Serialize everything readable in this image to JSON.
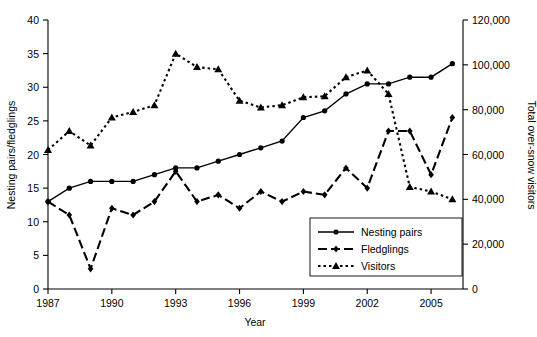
{
  "chart_data": {
    "type": "line",
    "title": "",
    "xlabel": "Year",
    "ylabel": "Nesting pairs/fledglings",
    "y2label": "Total over-snow visitors",
    "grid": false,
    "legend_position": "bottom-right",
    "xlim": [
      1987,
      2006.5
    ],
    "ylim": [
      0,
      40
    ],
    "y2lim": [
      0,
      120000
    ],
    "x_ticks": [
      1987,
      1990,
      1993,
      1996,
      1999,
      2002,
      2005
    ],
    "x_tick_labels": [
      "1987",
      "1990",
      "1993",
      "1996",
      "1999",
      "2002",
      "2005"
    ],
    "y_ticks": [
      0,
      5,
      10,
      15,
      20,
      25,
      30,
      35,
      40
    ],
    "y_tick_labels": [
      "0",
      "5",
      "10",
      "15",
      "20",
      "25",
      "30",
      "35",
      "40"
    ],
    "y2_ticks": [
      0,
      20000,
      40000,
      60000,
      80000,
      100000,
      120000
    ],
    "y2_tick_labels": [
      "0",
      "20,000",
      "40,000",
      "60,000",
      "80,000",
      "100,000",
      "120,000"
    ],
    "x": [
      1987,
      1988,
      1989,
      1990,
      1991,
      1992,
      1993,
      1994,
      1995,
      1996,
      1997,
      1998,
      1999,
      2000,
      2001,
      2002,
      2003,
      2004,
      2005,
      2006
    ],
    "series": [
      {
        "name": "Nesting pairs",
        "axis": "left",
        "marker": "circle",
        "linestyle": "solid",
        "values": [
          13,
          15,
          16,
          16,
          16,
          17,
          18,
          18,
          19,
          20,
          21,
          22,
          25.5,
          26.5,
          29,
          30.5,
          30.5,
          31.5,
          31.5,
          33.5
        ]
      },
      {
        "name": "Fledglings",
        "axis": "left",
        "marker": "diamond",
        "linestyle": "dashed",
        "values": [
          13,
          11,
          3,
          12,
          11,
          13,
          17.5,
          13,
          14,
          12,
          14.5,
          13,
          14.5,
          14,
          18,
          15,
          23.5,
          23.5,
          17,
          25.5
        ]
      },
      {
        "name": "Visitors",
        "axis": "right",
        "marker": "triangle",
        "linestyle": "dotted",
        "values_right_axis": [
          62000,
          70500,
          64000,
          76500,
          79000,
          82000,
          105000,
          99000,
          98000,
          84000,
          81000,
          82000,
          85500,
          86000,
          94500,
          97500,
          87000,
          45500,
          43500,
          40000
        ],
        "values_left_scale": [
          20.6,
          23.5,
          21.3,
          25.5,
          26.3,
          27.3,
          35.0,
          33.0,
          32.7,
          28.0,
          27.0,
          27.3,
          28.5,
          28.7,
          31.5,
          32.5,
          29.0,
          15.2,
          14.5,
          13.3
        ]
      }
    ],
    "legend_entries": [
      "Nesting pairs",
      "Fledglings",
      "Visitors"
    ]
  },
  "axes": {
    "left_title": "Nesting pairs/fledglings",
    "right_title": "Total over-snow visitors",
    "bottom_title": "Year"
  },
  "legend": {
    "items": [
      {
        "label": "Nesting pairs",
        "marker": "circle",
        "dash": "none"
      },
      {
        "label": "Fledglings",
        "marker": "diamond",
        "dash": "dash"
      },
      {
        "label": "Visitors",
        "marker": "triangle",
        "dash": "dot"
      }
    ]
  },
  "colors": {
    "ink": "#000000",
    "background": "#ffffff"
  }
}
